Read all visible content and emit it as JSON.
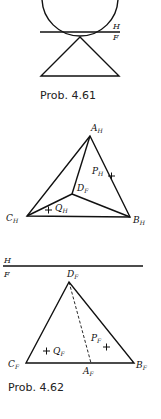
{
  "figures": [
    {
      "caption": "Prob. 4.61",
      "fold_line": {
        "upper": "H",
        "lower": "F"
      }
    },
    {
      "caption": "Prob. 4.62",
      "top_view_labels": {
        "A": "A",
        "A_sub": "H",
        "B": "B",
        "B_sub": "H",
        "C": "C",
        "C_sub": "H",
        "D": "D",
        "D_sub": "F",
        "P": "P",
        "P_sub": "H",
        "Q": "Q",
        "Q_sub": "H"
      },
      "fold_line": {
        "upper": "H",
        "lower": "F"
      },
      "front_view_labels": {
        "A": "A",
        "A_sub": "F",
        "B": "B",
        "B_sub": "F",
        "C": "C",
        "C_sub": "F",
        "D": "D",
        "D_sub": "F",
        "P": "P",
        "P_sub": "F",
        "Q": "Q",
        "Q_sub": "F"
      }
    }
  ],
  "colors": {
    "line": "#111111",
    "background": "#ffffff"
  }
}
